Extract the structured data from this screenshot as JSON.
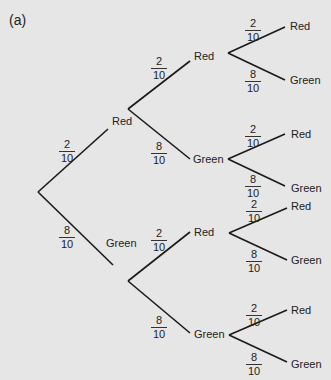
{
  "title": "(a)",
  "nodes": {
    "l1_red": "Red",
    "l1_green": "Green",
    "l2_rr": "Red",
    "l2_rg": "Green",
    "l2_gr": "Red",
    "l2_gg": "Green",
    "l3_rrr": "Red",
    "l3_rrg": "Green",
    "l3_rgr": "Red",
    "l3_rgg": "Green",
    "l3_grr": "Red",
    "l3_grg": "Green",
    "l3_ggr": "Red",
    "l3_ggg": "Green"
  },
  "probabilities": {
    "red": {
      "num": "2",
      "den": "10"
    },
    "green": {
      "num": "8",
      "den": "10"
    }
  },
  "colors": {
    "background": "#e6e6e6",
    "line": "#1a1a1a",
    "text": "#222222"
  }
}
